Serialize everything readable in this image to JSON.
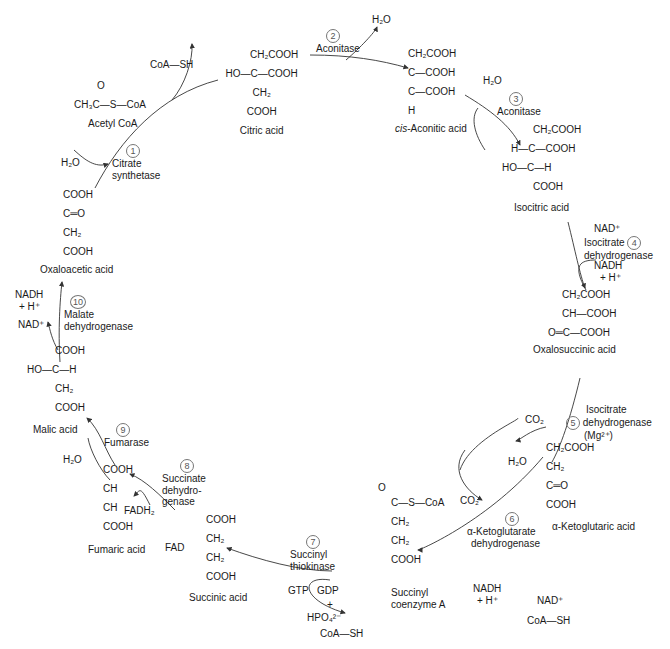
{
  "compounds": {
    "acetyl_coa": {
      "formula_top": "O",
      "formula": "CH₃C—S—CoA",
      "name": "Acetyl CoA"
    },
    "citric_acid": {
      "lines": [
        "CH₂COOH",
        "HO—C—COOH",
        "CH₂",
        "COOH"
      ],
      "name": "Citric acid"
    },
    "cis_aconitic_acid": {
      "lines": [
        "CH₂COOH",
        "C—COOH",
        "C—COOH",
        "H"
      ],
      "name_prefix": "cis",
      "name": "-Aconitic acid"
    },
    "isocitric_acid": {
      "lines": [
        "CH₂COOH",
        "H—C—COOH",
        "HO—C—H",
        "COOH"
      ],
      "name": "Isocitric acid"
    },
    "oxalosuccinic_acid": {
      "lines": [
        "CH₂COOH",
        "CH—COOH",
        "O═C—COOH"
      ],
      "name": "Oxalosuccinic acid"
    },
    "alpha_ketoglutaric_acid": {
      "lines": [
        "CH₂COOH",
        "CH₂",
        "C═O",
        "COOH"
      ],
      "name": "α-Ketoglutaric acid"
    },
    "succinyl_coa": {
      "lines": [
        "C—S—CoA",
        "CH₂",
        "CH₂",
        "COOH"
      ],
      "top": "O",
      "name_line1": "Succinyl",
      "name_line2": "coenzyme A"
    },
    "succinic_acid": {
      "lines": [
        "COOH",
        "CH₂",
        "CH₂",
        "COOH"
      ],
      "name": "Succinic acid"
    },
    "fumaric_acid": {
      "lines": [
        "COOH",
        "CH",
        "CH",
        "COOH"
      ],
      "name": "Fumaric acid"
    },
    "malic_acid": {
      "lines": [
        "COOH",
        "HO—C—H",
        "CH₂",
        "COOH"
      ],
      "name": "Malic acid"
    },
    "oxaloacetic_acid": {
      "lines": [
        "COOH",
        "C═O",
        "CH₂",
        "COOH"
      ],
      "name": "Oxaloacetic acid"
    }
  },
  "steps": [
    {
      "num": "1",
      "enzyme": [
        "Citrate",
        "synthetase"
      ],
      "cofactors": [
        "H₂O",
        "CoA—SH"
      ]
    },
    {
      "num": "2",
      "enzyme": [
        "Aconitase"
      ],
      "cofactors": [
        "H₂O"
      ]
    },
    {
      "num": "3",
      "enzyme": [
        "Aconitase"
      ],
      "cofactors": [
        "H₂O"
      ]
    },
    {
      "num": "4",
      "enzyme": [
        "Isocitrate",
        "dehydrogenase"
      ],
      "cofactors": [
        "NAD⁺",
        "NADH",
        "+ H⁺"
      ]
    },
    {
      "num": "5",
      "enzyme": [
        "Isocitrate",
        "dehydrogenase",
        "(Mg²⁺)"
      ],
      "cofactors": [
        "CO₂"
      ]
    },
    {
      "num": "6",
      "enzyme": [
        "α-Ketoglutarate",
        "dehydrogenase"
      ],
      "cofactors": [
        "CO₂",
        "NADH",
        "+ H⁺",
        "H₂O",
        "NAD⁺",
        "CoA—SH"
      ]
    },
    {
      "num": "7",
      "enzyme": [
        "Succinyl",
        "thiokinase"
      ],
      "cofactors": [
        "GTP",
        "GDP",
        "+",
        "HPO₄²⁻",
        "CoA—SH"
      ]
    },
    {
      "num": "8",
      "enzyme": [
        "Succinate",
        "dehydro-",
        "genase"
      ],
      "cofactors": [
        "FADH₂",
        "FAD"
      ]
    },
    {
      "num": "9",
      "enzyme": [
        "Fumarase"
      ],
      "cofactors": [
        "H₂O"
      ]
    },
    {
      "num": "10",
      "enzyme": [
        "Malate",
        "dehydrogenase"
      ],
      "cofactors": [
        "NADH",
        "+ H⁺",
        "NAD⁺"
      ]
    }
  ]
}
